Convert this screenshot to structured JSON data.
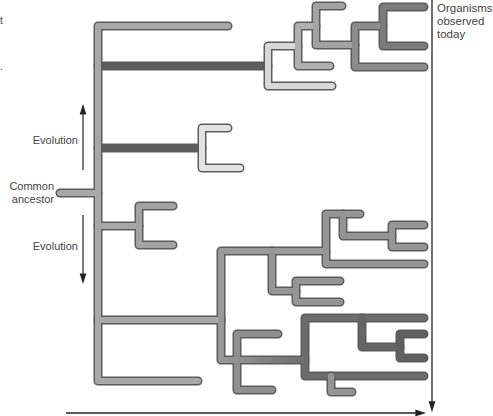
{
  "labels": {
    "organisms": [
      "Organisms",
      "observed",
      "today"
    ],
    "evolution_up": "Evolution",
    "evolution_down": "Evolution",
    "common_ancestor": [
      "Common",
      "ancestor"
    ],
    "edge_fragment_top": "t",
    "edge_fragment_mid": "."
  },
  "colors": {
    "light_gray": "#c8c8c8",
    "mid_gray": "#a6a6a6",
    "dark_gray": "#7e7e7e",
    "darker_gray": "#6a6a6a",
    "outline": "#5a5a5a",
    "axis": "#222222"
  }
}
